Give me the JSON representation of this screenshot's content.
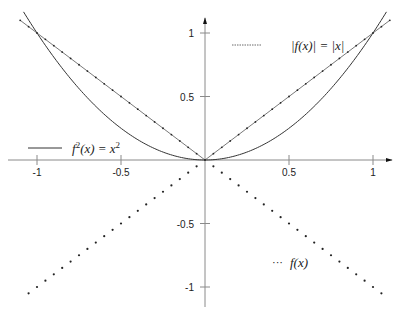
{
  "chart_data": {
    "type": "line",
    "title": "",
    "xlabel": "",
    "ylabel": "",
    "xlim": [
      -1.1,
      1.1
    ],
    "ylim": [
      -1.1,
      1.1
    ],
    "grid": false,
    "axes_style": "centered-with-arrows",
    "x_ticks": [
      -1,
      -0.5,
      0.5,
      1
    ],
    "x_tick_labels": [
      "-1",
      "-0.5",
      "0.5",
      "1"
    ],
    "y_ticks": [
      1,
      0.5,
      -0.5,
      -1
    ],
    "y_tick_labels": [
      "1",
      "0.5",
      "-0.5",
      "-1"
    ],
    "series": [
      {
        "name": "f^2(x) = x^2",
        "legend_label": "f²(x) = x²",
        "style": "solid",
        "formula": "x^2",
        "x": [
          -1.08,
          -1.0,
          -0.75,
          -0.5,
          -0.25,
          0,
          0.25,
          0.5,
          0.75,
          1.0,
          1.08
        ],
        "values": [
          1.1664,
          1.0,
          0.5625,
          0.25,
          0.0625,
          0,
          0.0625,
          0.25,
          0.5625,
          1.0,
          1.1664
        ]
      },
      {
        "name": "|f(x)| = |x|",
        "legend_label": "|f(x)| = |x|",
        "style": "dash-dot",
        "formula": "abs(x)",
        "x": [
          -1.1,
          -1.0,
          -0.5,
          0,
          0.5,
          1.0,
          1.1
        ],
        "values": [
          1.1,
          1.0,
          0.5,
          0,
          0.5,
          1.0,
          1.1
        ]
      },
      {
        "name": "f(x)",
        "legend_label": "f(x)",
        "style": "dotted",
        "formula": "-abs(x)",
        "x": [
          -1.05,
          -1.0,
          -0.5,
          0,
          0.5,
          1.0,
          1.05
        ],
        "values": [
          -1.05,
          -1.0,
          -0.5,
          0,
          -0.5,
          -1.0,
          -1.05
        ]
      }
    ],
    "legend": [
      {
        "label": "|f(x)| = |x|",
        "style": "dash-dot",
        "position": "upper-right"
      },
      {
        "label": "f²(x) = x²",
        "style": "solid",
        "position": "upper-left, just above x-axis"
      },
      {
        "label": "f(x)",
        "style": "dotted",
        "position": "lower-right"
      }
    ]
  },
  "axes": {
    "x_ticks": [
      {
        "value": -1,
        "label": "-1"
      },
      {
        "value": -0.5,
        "label": "-0.5"
      },
      {
        "value": 0.5,
        "label": "0.5"
      },
      {
        "value": 1,
        "label": "1"
      }
    ],
    "y_ticks": [
      {
        "value": 1,
        "label": "1"
      },
      {
        "value": 0.5,
        "label": "0.5"
      },
      {
        "value": -0.5,
        "label": "-0.5"
      },
      {
        "value": -1,
        "label": "-1"
      }
    ]
  },
  "legend": {
    "abs": {
      "lhs": "|f(x)| = |x|"
    },
    "square": {
      "f": "f",
      "sup": "2",
      "mid": "(x) = x",
      "sup2": "2"
    },
    "fx": {
      "dots": "···",
      "label": "f(x)"
    }
  },
  "colors": {
    "axis": "#8a8a8a",
    "curve": "#333333",
    "text": "#222222",
    "background": "#ffffff"
  }
}
